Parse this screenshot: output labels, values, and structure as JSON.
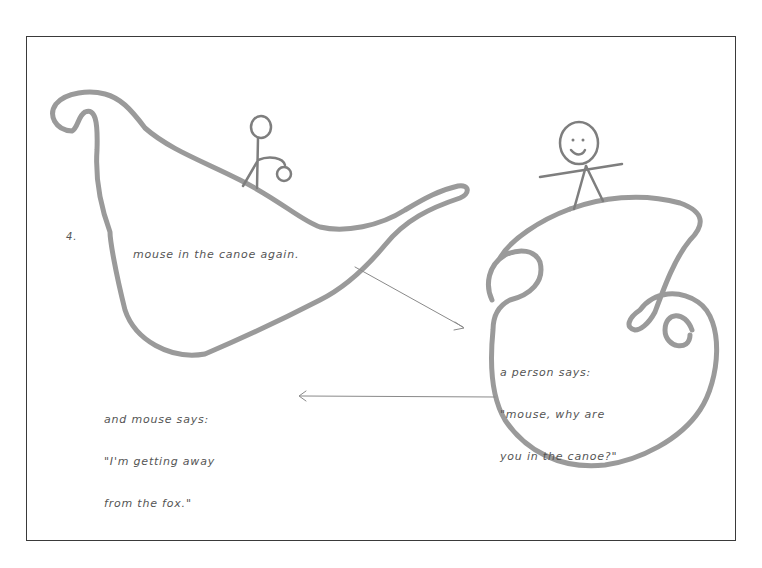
{
  "illustration": {
    "page_number": "4.",
    "caption": "mouse in the canoe again.",
    "person_speech": {
      "line1": "a person says:",
      "line2": "\"mouse, why are",
      "line3": "you in the canoe?\""
    },
    "mouse_speech": {
      "line1": "and mouse says:",
      "line2": "\"I'm getting away",
      "line3": "from the fox.\""
    },
    "figures": [
      "stick-figure-mouse-in-canoe",
      "smiling-person-on-island"
    ],
    "colors": {
      "stroke": "#9a9a9a",
      "ink": "#555555",
      "frame": "#3a3a3a",
      "background": "#ffffff"
    }
  }
}
